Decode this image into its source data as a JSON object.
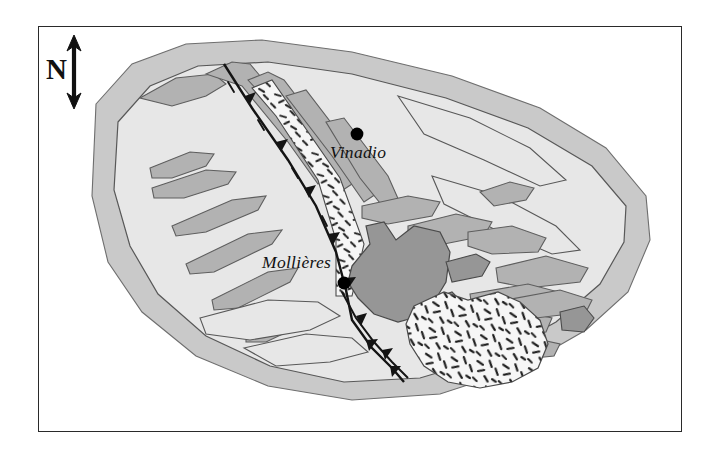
{
  "figure": {
    "type": "geological-sketch-map",
    "background_color": "#ffffff",
    "frame": {
      "border_color": "#2a2a2a",
      "x": 38,
      "y": 26,
      "width": 644,
      "height": 406
    }
  },
  "north_arrow": {
    "label": "N",
    "icon": "north-arrow-icon",
    "description": "double-headed vertical arrow with letter N"
  },
  "localities": [
    {
      "name": "Vinadio",
      "dot_x": 357,
      "dot_y": 134,
      "label_x": 330,
      "label_y": 142
    },
    {
      "name": "Mollières",
      "dot_x": 344,
      "dot_y": 283,
      "label_x": 262,
      "label_y": 252
    }
  ],
  "colors": {
    "page": "#ffffff",
    "frame_line": "#2a2a2a",
    "outer_halo": "#c9c9c9",
    "massif_interior": "#e7e7e7",
    "lens_grey": "#b2b2b2",
    "dark_unit": "#969696",
    "stipple_field": "#f4f4f4",
    "stipple_mark": "#1c1c1c",
    "outline": "#4a4a4a",
    "fault_line": "#141414",
    "locality_dot": "#000000"
  },
  "legend_units": [
    {
      "id": "outer-halo",
      "label": "outer envelope",
      "fill": "#c9c9c9"
    },
    {
      "id": "massif-interior",
      "label": "massif interior",
      "fill": "#e7e7e7"
    },
    {
      "id": "grey-lenses",
      "label": "elongate grey bodies",
      "fill": "#b2b2b2"
    },
    {
      "id": "dark-unit",
      "label": "dark central unit",
      "fill": "#969696"
    },
    {
      "id": "stippled-unit",
      "label": "stippled unit",
      "fill": "#f4f4f4"
    }
  ],
  "structures": {
    "thrust_faults": "barbed triangular teeth along principal NE-SW fault traces",
    "trend": "NE-SW elongated massif"
  }
}
